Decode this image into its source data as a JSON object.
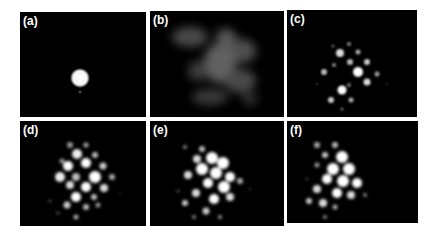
{
  "figure": {
    "panels": [
      {
        "id": "a",
        "label": "(a)",
        "description": "single bright central spot"
      },
      {
        "id": "b",
        "label": "(b)",
        "description": "diffuse speckle pattern"
      },
      {
        "id": "c",
        "label": "(c)",
        "description": "sparse lattice of spots"
      },
      {
        "id": "d",
        "label": "(d)",
        "description": "denser lattice of spots"
      },
      {
        "id": "e",
        "label": "(e)",
        "description": "bright clustered lattice"
      },
      {
        "id": "f",
        "label": "(f)",
        "description": "bright clustered lattice"
      }
    ],
    "colors": {
      "background": "#000000",
      "spot": "#ffffff",
      "page": "#ffffff"
    }
  }
}
